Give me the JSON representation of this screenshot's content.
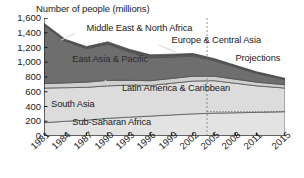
{
  "chart_data": {
    "type": "area",
    "title": "",
    "ylabel": "Number of people (millions)",
    "xlabel": "",
    "ylim": [
      0,
      1600
    ],
    "yticks": [
      "0",
      "200",
      "400",
      "600",
      "800",
      "1,000",
      "1,200",
      "1,400",
      "1,600"
    ],
    "ytick_values": [
      0,
      200,
      400,
      600,
      800,
      1000,
      1200,
      1400,
      1600
    ],
    "grid": false,
    "legend_position": "inline-annotations",
    "stacked": true,
    "x": [
      1981,
      1984,
      1987,
      1990,
      1993,
      1996,
      1999,
      2002,
      2005,
      2008,
      2011,
      2015
    ],
    "xticks": [
      "1981",
      "1984",
      "1987",
      "1990",
      "1993",
      "1996",
      "1999",
      "2002",
      "2005",
      "2008",
      "2011",
      "2015"
    ],
    "projection_start": 2004,
    "annotations": [
      {
        "text": "Projections",
        "x": 2008,
        "y": 1050
      },
      {
        "text": "Middle East & North Africa",
        "x": 1987,
        "y": 1450
      },
      {
        "text": "Europe & Central Asia",
        "x": 1999,
        "y": 1290
      },
      {
        "text": "East Asia & Pacific",
        "x": 1985,
        "y": 1030
      },
      {
        "text": "Latin America & Caribbean",
        "x": 1992,
        "y": 640
      },
      {
        "text": "South Asia",
        "x": 1982,
        "y": 420
      },
      {
        "text": "Sub-Saharan Africa",
        "x": 1985,
        "y": 180
      }
    ],
    "series": [
      {
        "name": "Sub-Saharan Africa",
        "color": "#e3e3e3",
        "values": [
          180,
          200,
          215,
          240,
          255,
          270,
          285,
          300,
          310,
          315,
          320,
          330
        ]
      },
      {
        "name": "South Asia",
        "color": "#dcdcdc",
        "values": [
          470,
          455,
          445,
          440,
          435,
          415,
          430,
          445,
          440,
          400,
          360,
          320
        ]
      },
      {
        "name": "Latin America & Caribbean",
        "color": "#cfcfcf",
        "values": [
          60,
          65,
          70,
          75,
          65,
          65,
          65,
          65,
          60,
          55,
          50,
          45
        ]
      },
      {
        "name": "East Asia & Pacific",
        "color": "#6e6e6e",
        "values": [
          795,
          565,
          455,
          490,
          385,
          310,
          290,
          275,
          210,
          165,
          120,
          70
        ]
      },
      {
        "name": "Europe & Central Asia",
        "color": "#5e5e5e",
        "values": [
          10,
          12,
          14,
          17,
          22,
          26,
          25,
          22,
          18,
          14,
          11,
          8
        ]
      },
      {
        "name": "Middle East & North Africa",
        "color": "#555555",
        "values": [
          14,
          14,
          14,
          15,
          15,
          15,
          14,
          13,
          12,
          11,
          10,
          9
        ]
      }
    ]
  }
}
